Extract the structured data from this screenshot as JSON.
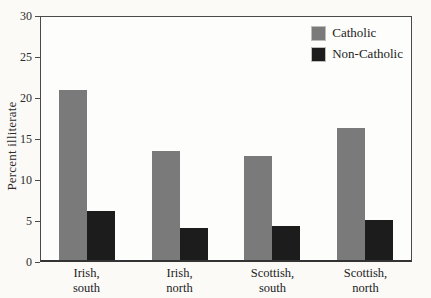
{
  "chart_data": {
    "type": "bar",
    "title": "",
    "xlabel": "",
    "ylabel": "Percent illiterate",
    "categories": [
      "Irish, south",
      "Irish, north",
      "Scottish, south",
      "Scottish, north"
    ],
    "series": [
      {
        "name": "Catholic",
        "color": "#7a7a7a",
        "values": [
          21.0,
          13.4,
          12.8,
          16.3
        ]
      },
      {
        "name": "Non-Catholic",
        "color": "#1c1c1c",
        "values": [
          6.1,
          3.9,
          4.2,
          4.9
        ]
      }
    ],
    "ylim": [
      0,
      30
    ],
    "yticks": [
      0,
      5,
      10,
      15,
      20,
      25,
      30
    ],
    "grid": false,
    "legend_position": "top-right-inside",
    "bar_width_px": 28,
    "colors": {
      "axis": "#4a4a4a",
      "page_background": "#fbfaf7",
      "plot_background": "#fdfdfb",
      "text": "#2b2b2b"
    }
  }
}
